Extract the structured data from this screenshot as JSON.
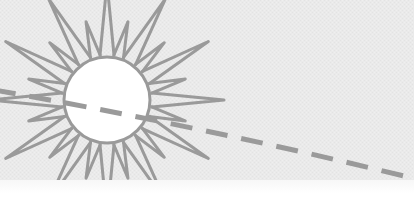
{
  "canvas": {
    "width": 414,
    "height": 210,
    "alt_text": "Sun illustration with dashed path"
  },
  "colors": {
    "background_gray": "#eaeaea",
    "background_gray_light": "#efefef",
    "band_white": "#ffffff",
    "stroke_gray": "#9a9a9a",
    "stroke_gray_soft": "#a5a5a5",
    "sun_fill": "#ffffff",
    "texture_gray": "#e2e2e2"
  },
  "background": {
    "name": "paper-background",
    "fill": "#eaeaea",
    "band": {
      "name": "bottom-white-band",
      "y": 180,
      "height": 30,
      "fill": "#ffffff"
    }
  },
  "sun": {
    "label": "sun",
    "center_x": 107,
    "center_y": 100,
    "core_radius": 43,
    "stroke_width": 3,
    "stroke": "#9a9a9a",
    "fill": "#ffffff",
    "ray_count": 24,
    "ray_long_length": 72,
    "ray_short_length": 36,
    "ray_long_half_width": 7,
    "ray_short_half_width": 5,
    "ray_start_offset": 2,
    "rotation_deg": -90
  },
  "dashed_path": {
    "label": "dashed-trajectory-line",
    "stroke": "#9a9a9a",
    "stroke_width": 5,
    "dash_pattern": "22 14",
    "start_x": -6,
    "start_y": 90,
    "control_x": 200,
    "control_y": 126,
    "end_x": 412,
    "end_y": 178
  },
  "chart_data": {
    "type": "scatter",
    "title": "",
    "xlabel": "",
    "ylabel": "",
    "series": [
      {
        "name": "dashed-trajectory",
        "points": [
          [
            -6,
            90
          ],
          [
            100,
            110
          ],
          [
            200,
            126
          ],
          [
            300,
            150
          ],
          [
            412,
            178
          ]
        ]
      }
    ],
    "annotations": [
      {
        "name": "sun",
        "x": 107,
        "y": 100,
        "radius": 43
      }
    ],
    "grid": false,
    "legend": "none"
  }
}
